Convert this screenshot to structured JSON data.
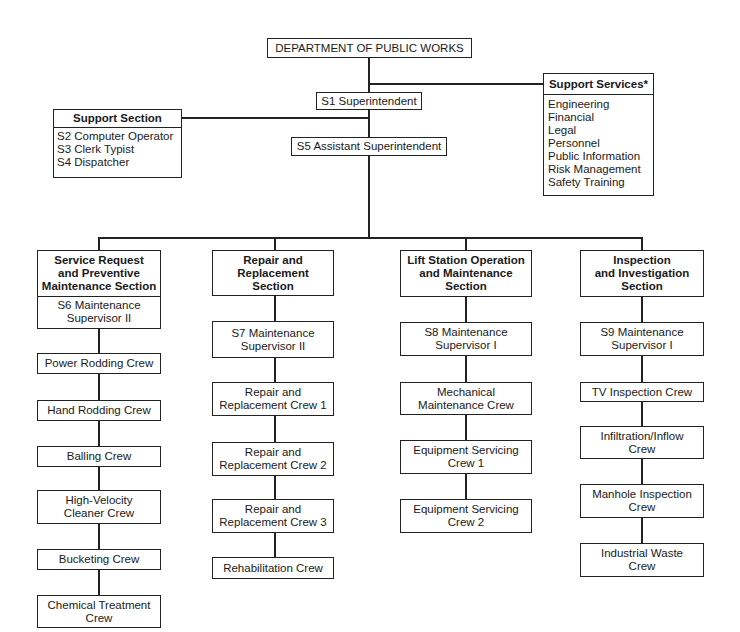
{
  "chart": {
    "title": "DEPARTMENT OF PUBLIC WORKS",
    "superintendent": "S1 Superintendent",
    "assistant_superintendent": "S5 Assistant Superintendent",
    "support_section": {
      "title": "Support Section",
      "items": [
        "S2 Computer Operator",
        "S3 Clerk Typist",
        "S4 Dispatcher"
      ]
    },
    "support_services": {
      "title": "Support Services*",
      "items": [
        "Engineering",
        "Financial",
        "Legal",
        "Personnel",
        "Public Information",
        "Risk Management",
        "Safety Training"
      ]
    },
    "sections": [
      {
        "title": "Service Request\nand Preventive\nMaintenance Section",
        "supervisor": "S6 Maintenance\nSupervisor II",
        "crews": [
          "Power Rodding Crew",
          "Hand Rodding Crew",
          "Balling Crew",
          "High-Velocity\nCleaner Crew",
          "Bucketing Crew",
          "Chemical Treatment\nCrew"
        ]
      },
      {
        "title": "Repair and\nReplacement\nSection",
        "supervisor": "S7 Maintenance\nSupervisor II",
        "crews": [
          "Repair and\nReplacement Crew 1",
          "Repair and\nReplacement Crew 2",
          "Repair and\nReplacement Crew 3",
          "Rehabilitation Crew"
        ]
      },
      {
        "title": "Lift Station Operation\nand Maintenance\nSection",
        "supervisor": "S8 Maintenance\nSupervisor I",
        "crews": [
          "Mechanical\nMaintenance Crew",
          "Equipment Servicing\nCrew 1",
          "Equipment Servicing\nCrew 2"
        ]
      },
      {
        "title": "Inspection\nand Investigation\nSection",
        "supervisor": "S9 Maintenance\nSupervisor I",
        "crews": [
          "TV Inspection Crew",
          "Infiltration/Inflow\nCrew",
          "Manhole Inspection\nCrew",
          "Industrial Waste\nCrew"
        ]
      }
    ]
  }
}
